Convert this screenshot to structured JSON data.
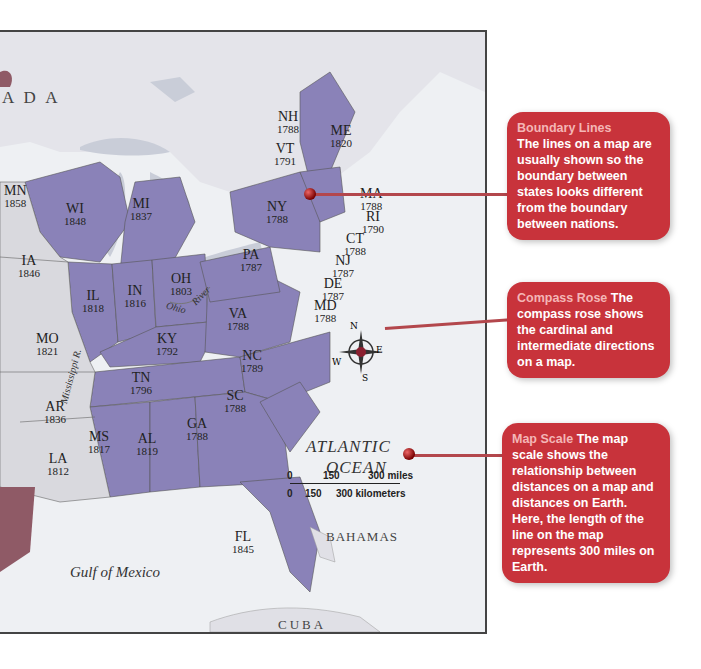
{
  "map": {
    "region_label": "A D A",
    "water_labels": {
      "atlantic_line1": "ATLANTIC",
      "atlantic_line2": "OCEAN",
      "gulf": "Gulf of Mexico",
      "ohio": "Ohio",
      "river": "River",
      "mississippi": "Mississippi R."
    },
    "places": {
      "bahamas": "BAHAMAS",
      "cuba": "CUBA"
    },
    "states": [
      {
        "abbr": "MN",
        "year": "1858"
      },
      {
        "abbr": "WI",
        "year": "1848"
      },
      {
        "abbr": "MI",
        "year": "1837"
      },
      {
        "abbr": "IA",
        "year": "1846"
      },
      {
        "abbr": "IL",
        "year": "1818"
      },
      {
        "abbr": "IN",
        "year": "1816"
      },
      {
        "abbr": "OH",
        "year": "1803"
      },
      {
        "abbr": "MO",
        "year": "1821"
      },
      {
        "abbr": "KY",
        "year": "1792"
      },
      {
        "abbr": "TN",
        "year": "1796"
      },
      {
        "abbr": "AR",
        "year": "1836"
      },
      {
        "abbr": "LA",
        "year": "1812"
      },
      {
        "abbr": "MS",
        "year": "1817"
      },
      {
        "abbr": "AL",
        "year": "1819"
      },
      {
        "abbr": "GA",
        "year": "1788"
      },
      {
        "abbr": "SC",
        "year": "1788"
      },
      {
        "abbr": "NC",
        "year": "1789"
      },
      {
        "abbr": "VA",
        "year": "1788"
      },
      {
        "abbr": "PA",
        "year": "1787"
      },
      {
        "abbr": "NY",
        "year": "1788"
      },
      {
        "abbr": "NH",
        "year": "1788"
      },
      {
        "abbr": "VT",
        "year": "1791"
      },
      {
        "abbr": "ME",
        "year": "1820"
      },
      {
        "abbr": "MA",
        "year": "1788"
      },
      {
        "abbr": "RI",
        "year": "1790"
      },
      {
        "abbr": "CT",
        "year": "1788"
      },
      {
        "abbr": "NJ",
        "year": "1787"
      },
      {
        "abbr": "DE",
        "year": "1787"
      },
      {
        "abbr": "MD",
        "year": "1788"
      },
      {
        "abbr": "FL",
        "year": "1845"
      }
    ],
    "compass": {
      "n": "N",
      "s": "S",
      "e": "E",
      "w": "W"
    },
    "scale": {
      "miles_zero": "0",
      "miles_mid": "150",
      "miles_end": "300 miles",
      "km_zero": "0",
      "km_mid": "150",
      "km_end": "300 kilometers"
    }
  },
  "callouts": [
    {
      "heading": "Boundary Lines",
      "body": "The lines on a map are usually shown so the boundary between states looks different from the boundary between nations."
    },
    {
      "heading": "Compass Rose",
      "body": "The compass rose shows the cardinal and intermediate directions on a map."
    },
    {
      "heading": "Map Scale",
      "body": "The map scale shows the relationship between distances on a map and distances on Earth. Here, the length of the line on the map represents 300 miles on Earth."
    }
  ],
  "colors": {
    "callout_bg": "#c8333b",
    "state_fill": "#8a82b8",
    "land_other": "#d9d9de",
    "water": "#eef0f3"
  }
}
